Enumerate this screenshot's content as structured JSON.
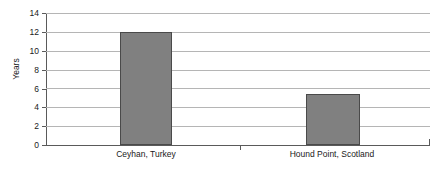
{
  "chart_data": {
    "type": "bar",
    "title": "",
    "subtitle": "",
    "xlabel": "",
    "ylabel": "Years",
    "categories": [
      "Ceyhan, Turkey",
      "Hound Point, Scotland"
    ],
    "values": [
      12,
      5.4
    ],
    "series": [
      {
        "name": "Years",
        "values": [
          12,
          5.4
        ]
      }
    ],
    "ylim": [
      0,
      14
    ],
    "yticks": [
      0,
      2,
      4,
      6,
      8,
      10,
      12,
      14
    ],
    "ytick_labels": [
      "0",
      "2",
      "4",
      "6",
      "8",
      "10",
      "12",
      "14"
    ],
    "grid": "horizontal",
    "legend": "none",
    "annotations": [],
    "colors": {
      "bar_fill": "#808080",
      "bar_border": "#4a4a4a",
      "gridline": "#b5b5b5",
      "axis": "#5a5a5a",
      "text": "#1a1a1a",
      "background": "#ffffff"
    }
  }
}
